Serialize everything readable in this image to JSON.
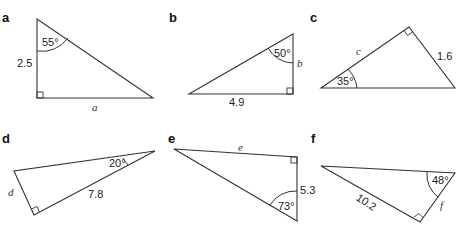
{
  "figure": {
    "triangles": [
      {
        "label": "a",
        "angle": "55°",
        "side": "2.5",
        "unknown": "a"
      },
      {
        "label": "b",
        "angle": "50°",
        "side": "4.9",
        "unknown": "b"
      },
      {
        "label": "c",
        "angle": "35°",
        "side": "1.6",
        "unknown": "c"
      },
      {
        "label": "d",
        "angle": "20°",
        "side": "7.8",
        "unknown": "d"
      },
      {
        "label": "e",
        "angle": "73°",
        "side": "5.3",
        "unknown": "e"
      },
      {
        "label": "f",
        "angle": "48°",
        "side": "10.2",
        "unknown": "f"
      }
    ]
  },
  "colors": {
    "stroke": "#333333",
    "text": "#222222",
    "background": "#ffffff"
  }
}
